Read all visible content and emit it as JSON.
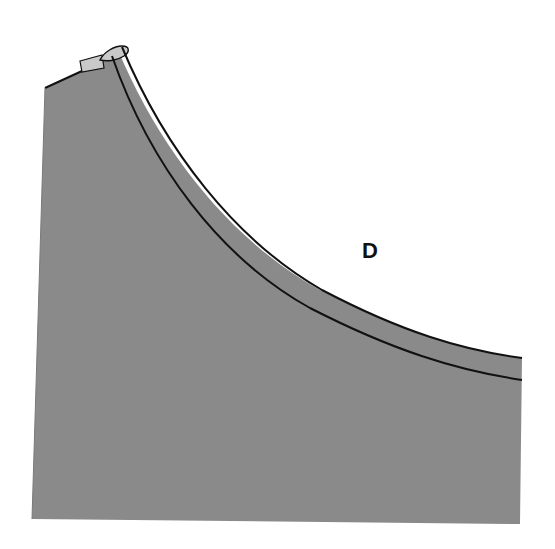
{
  "figure": {
    "label": "D",
    "colors": {
      "fabric": "#8a8a8a",
      "fabric_fold_highlight": "#c9c9c9",
      "outline": "#111111",
      "background": "#ffffff"
    }
  }
}
